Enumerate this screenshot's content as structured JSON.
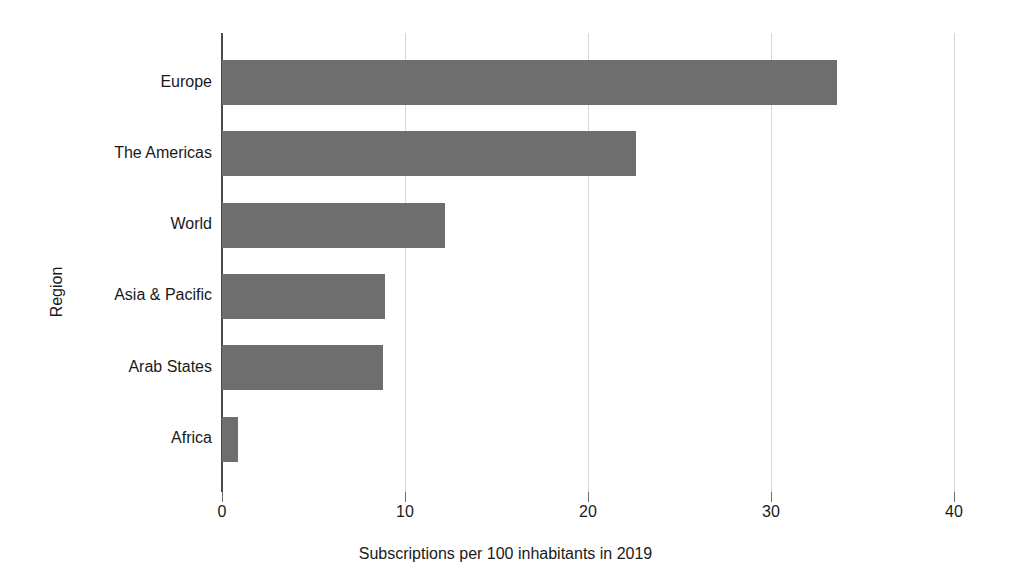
{
  "chart_data": {
    "type": "bar",
    "orientation": "horizontal",
    "title": "",
    "xlabel": "Subscriptions per 100 inhabitants in 2019",
    "ylabel": "Region",
    "categories": [
      "Europe",
      "The Americas",
      "World",
      "Asia & Pacific",
      "Arab States",
      "Africa"
    ],
    "values": [
      33.6,
      22.6,
      12.2,
      8.9,
      8.8,
      0.9
    ],
    "series": [
      {
        "name": "Subscriptions per 100 inhabitants in 2019",
        "values": [
          33.6,
          22.6,
          12.2,
          8.9,
          8.8,
          0.9
        ]
      }
    ],
    "xlim": [
      0,
      40
    ],
    "xticks": [
      0,
      10,
      20,
      30,
      40
    ],
    "xtick_labels": [
      "0",
      "10",
      "20",
      "30",
      "40"
    ],
    "ytick_labels": [
      "Europe",
      "The Americas",
      "World",
      "Asia & Pacific",
      "Arab States",
      "Africa"
    ],
    "grid": "vertical-only",
    "legend": "none",
    "bar_color": "#6e6e6e",
    "gridline_color": "#d6d6d6",
    "axis_color": "#4a4a4a",
    "background_color": "#ffffff"
  }
}
